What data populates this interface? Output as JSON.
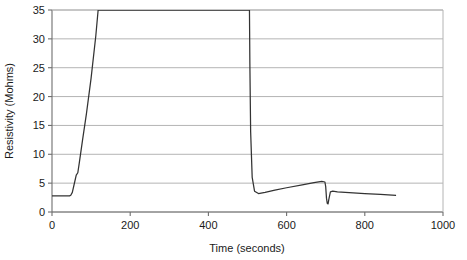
{
  "chart_data": {
    "type": "line",
    "title": "",
    "xlabel": "Time (seconds)",
    "ylabel": "Resistivity (Mohms)",
    "xlim": [
      0,
      1000
    ],
    "ylim": [
      0,
      35
    ],
    "xticks": [
      0,
      200,
      400,
      600,
      800,
      1000
    ],
    "yticks": [
      0,
      5,
      10,
      15,
      20,
      25,
      30,
      35
    ],
    "xtick_labels": [
      "0",
      "200",
      "400",
      "600",
      "800",
      "1000"
    ],
    "ytick_labels": [
      "0",
      "5",
      "10",
      "15",
      "20",
      "25",
      "30",
      "35"
    ],
    "grid": "horizontal",
    "legend": "none",
    "series": [
      {
        "name": "Resistivity",
        "color": "#333333",
        "x": [
          0,
          20,
          40,
          45,
          48,
          52,
          58,
          62,
          66,
          70,
          78,
          88,
          100,
          112,
          118,
          505,
          506,
          508,
          512,
          518,
          528,
          545,
          570,
          600,
          640,
          670,
          690,
          698,
          700,
          702,
          704,
          706,
          708,
          712,
          718,
          730,
          760,
          800,
          840,
          880
        ],
        "y": [
          2.8,
          2.8,
          2.8,
          2.8,
          2.9,
          3.4,
          5.2,
          6.4,
          6.8,
          8.6,
          12.4,
          17.0,
          23.2,
          30.5,
          35.0,
          35.0,
          26.0,
          14.0,
          6.0,
          3.6,
          3.2,
          3.4,
          3.8,
          4.2,
          4.7,
          5.1,
          5.3,
          5.2,
          4.4,
          2.4,
          1.5,
          1.4,
          2.2,
          3.5,
          3.6,
          3.5,
          3.35,
          3.2,
          3.05,
          2.9
        ]
      }
    ],
    "notes": [
      "Flat baseline near 2.8 Mohms until about 45 s",
      "Steep rise off the top of the axis by about 118 s",
      "Sharp vertical drop back on-scale at about 505 s",
      "Gradual climb from about 3.2 to 5.3 Mohms between 520 s and 690 s",
      "Narrow downward spike to about 1.4 Mohms near 706 s",
      "Slow decay to about 2.9 Mohms at the 880 s trace end"
    ]
  },
  "axes": {
    "x_title": "Time (seconds)",
    "y_title": "Resistivity (Mohms)"
  }
}
